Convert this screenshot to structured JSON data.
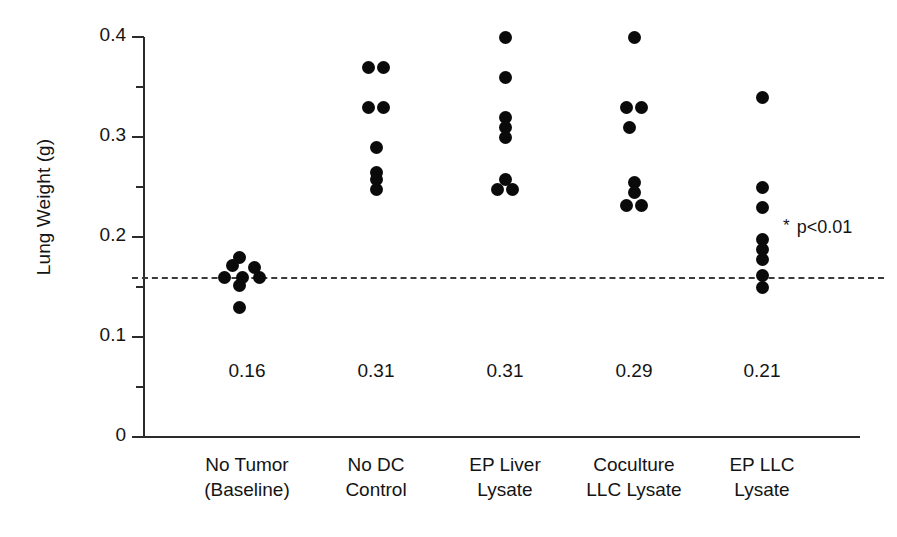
{
  "chart_data": {
    "type": "scatter",
    "title": "",
    "xlabel": "",
    "ylabel": "Lung Weight (g)",
    "ylim": [
      0,
      0.4
    ],
    "ytick_labels": [
      "0.4",
      "0.3",
      "0.2",
      "0.1",
      "0"
    ],
    "ytick_values": [
      0.4,
      0.3,
      0.2,
      0.1,
      0
    ],
    "yminor_ticks": [
      0.35,
      0.25,
      0.15,
      0.05
    ],
    "grid": false,
    "legend": "none",
    "categories": [
      "No Tumor (Baseline)",
      "No DC Control",
      "EP Liver Lysate",
      "Coculture LLC Lysate",
      "EP LLC Lysate"
    ],
    "category_label_lines": [
      [
        "No Tumor",
        "(Baseline)"
      ],
      [
        "No DC",
        "Control"
      ],
      [
        "EP Liver",
        "Lysate"
      ],
      [
        "Coculture",
        "LLC Lysate"
      ],
      [
        "EP LLC",
        "Lysate"
      ]
    ],
    "mean_labels": [
      "0.16",
      "0.31",
      "0.31",
      "0.29",
      "0.21"
    ],
    "means": [
      0.16,
      0.31,
      0.31,
      0.29,
      0.21
    ],
    "reference_line": {
      "value": 0.16,
      "style": "dashed",
      "label": "Baseline mean"
    },
    "annotations": [
      {
        "star": "*",
        "text": "p<0.01",
        "group": "EP LLC Lysate"
      }
    ],
    "groups": [
      {
        "name": "No Tumor (Baseline)",
        "points": [
          {
            "value": 0.18,
            "offset": -0.6
          },
          {
            "value": 0.172,
            "offset": -1.1
          },
          {
            "value": 0.17,
            "offset": 0.55
          },
          {
            "value": 0.16,
            "offset": -1.75
          },
          {
            "value": 0.16,
            "offset": -0.35
          },
          {
            "value": 0.16,
            "offset": 0.95
          },
          {
            "value": 0.152,
            "offset": -0.55
          },
          {
            "value": 0.13,
            "offset": -0.6
          }
        ]
      },
      {
        "name": "No DC Control",
        "points": [
          {
            "value": 0.37,
            "offset": -0.55
          },
          {
            "value": 0.37,
            "offset": 0.55
          },
          {
            "value": 0.33,
            "offset": -0.55
          },
          {
            "value": 0.33,
            "offset": 0.55
          },
          {
            "value": 0.29,
            "offset": 0.0
          },
          {
            "value": 0.265,
            "offset": 0.0
          },
          {
            "value": 0.258,
            "offset": 0.0
          },
          {
            "value": 0.248,
            "offset": 0.0
          }
        ]
      },
      {
        "name": "EP Liver Lysate",
        "points": [
          {
            "value": 0.4,
            "offset": 0.0
          },
          {
            "value": 0.36,
            "offset": 0.0
          },
          {
            "value": 0.32,
            "offset": 0.0
          },
          {
            "value": 0.31,
            "offset": 0.0
          },
          {
            "value": 0.3,
            "offset": 0.0
          },
          {
            "value": 0.258,
            "offset": 0.0
          },
          {
            "value": 0.248,
            "offset": -0.55
          },
          {
            "value": 0.248,
            "offset": 0.55
          }
        ]
      },
      {
        "name": "Coculture LLC Lysate",
        "points": [
          {
            "value": 0.4,
            "offset": 0.0
          },
          {
            "value": 0.33,
            "offset": -0.55
          },
          {
            "value": 0.33,
            "offset": 0.55
          },
          {
            "value": 0.31,
            "offset": -0.35
          },
          {
            "value": 0.255,
            "offset": 0.0
          },
          {
            "value": 0.245,
            "offset": 0.0
          },
          {
            "value": 0.232,
            "offset": -0.55
          },
          {
            "value": 0.232,
            "offset": 0.55
          }
        ]
      },
      {
        "name": "EP LLC Lysate",
        "points": [
          {
            "value": 0.34,
            "offset": 0.0
          },
          {
            "value": 0.25,
            "offset": 0.0
          },
          {
            "value": 0.23,
            "offset": 0.0
          },
          {
            "value": 0.198,
            "offset": 0.0
          },
          {
            "value": 0.188,
            "offset": 0.0
          },
          {
            "value": 0.178,
            "offset": 0.0
          },
          {
            "value": 0.162,
            "offset": 0.0
          },
          {
            "value": 0.15,
            "offset": 0.0
          }
        ]
      }
    ]
  },
  "colors": {
    "dot": "#0a0a0a",
    "axis": "#2b2b2b",
    "text": "#141414",
    "baseline": "#3a3a3a",
    "background": "#ffffff"
  }
}
